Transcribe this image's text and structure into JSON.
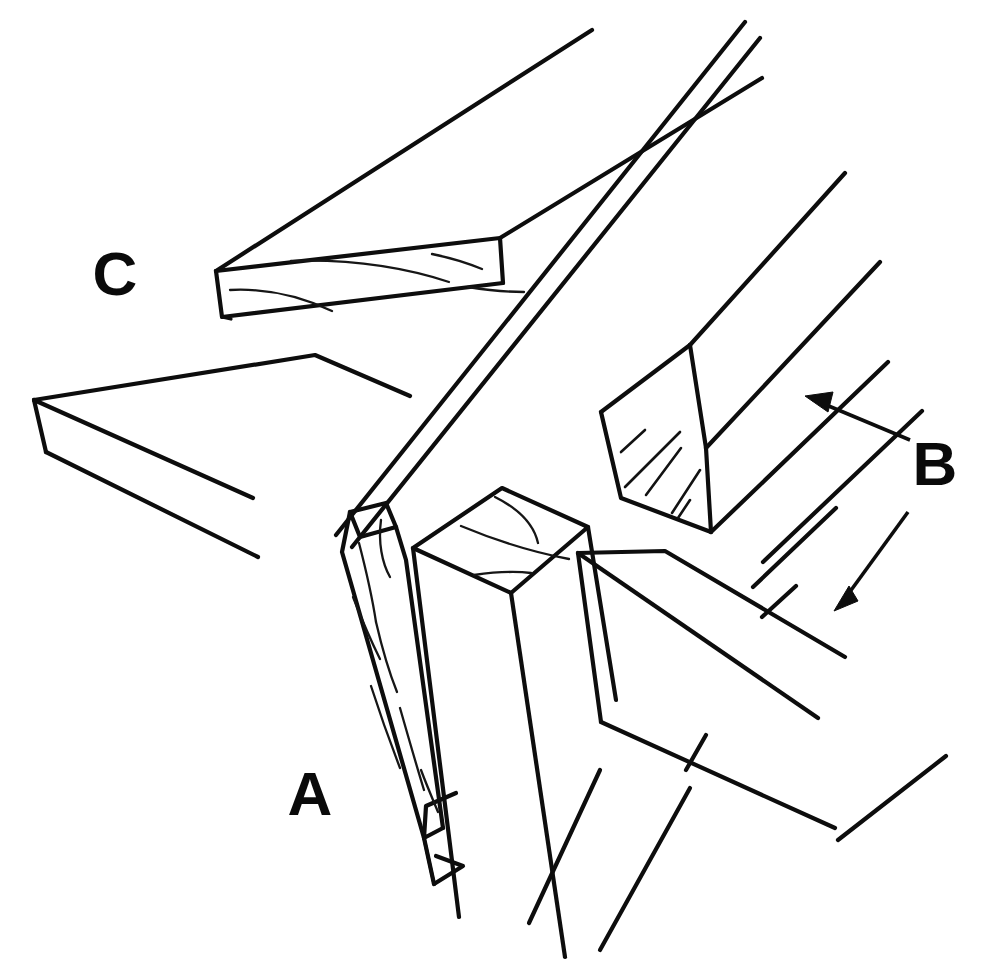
{
  "figure": {
    "background_color": "#ffffff",
    "line_color": "#0d0d0d",
    "width": 990,
    "height": 971,
    "style": "black ink technical line art, no fill, white background"
  },
  "labels": [
    {
      "id": "label-a",
      "text": "A",
      "x": 310,
      "y": 815,
      "describes": "notched narrow vertical strip / ledger at the corner post"
    },
    {
      "id": "label-b",
      "text": "B",
      "x": 935,
      "y": 485,
      "describes": "two square-section rails shown with leader arrows"
    },
    {
      "id": "label-c",
      "text": "C",
      "x": 115,
      "y": 295,
      "describes": "flat board with mitred end, upper left"
    }
  ],
  "leaders": [
    {
      "id": "leader-b-upper",
      "from_label": "B",
      "tail": [
        910,
        440
      ],
      "tip": [
        805,
        396
      ],
      "points_to": "upper square rail"
    },
    {
      "id": "leader-b-lower",
      "from_label": "B",
      "tail": [
        908,
        512
      ],
      "tip": [
        834,
        611
      ],
      "points_to": "lower square rail"
    }
  ],
  "members": [
    {
      "id": "member-c-board",
      "label": "C",
      "kind": "flat board",
      "end_treatment": "mitred / chamfered end",
      "has_grain_lines": true,
      "has_hatching": false
    },
    {
      "id": "left-panel",
      "label": "",
      "kind": "flat panel",
      "end_treatment": "open end",
      "has_grain_lines": false,
      "has_hatching": false
    },
    {
      "id": "member-a-strip",
      "label": "A",
      "kind": "narrow vertical strip",
      "end_treatment": "V-notch cut at lower end",
      "has_grain_lines": true,
      "has_hatching": false
    },
    {
      "id": "corner-post",
      "label": "",
      "kind": "square corner post",
      "end_treatment": "end grain arcs on top face",
      "has_grain_lines": true,
      "has_hatching": false
    },
    {
      "id": "member-b-upper-rail",
      "label": "B",
      "kind": "square rail",
      "end_treatment": "hatched end grain face",
      "has_grain_lines": false,
      "has_hatching": true
    },
    {
      "id": "member-b-lower-rail",
      "label": "B",
      "kind": "square rail",
      "end_treatment": "open end",
      "has_grain_lines": false,
      "has_hatching": false
    },
    {
      "id": "diagonal-strip",
      "label": "",
      "kind": "long narrow strip running diagonally",
      "end_treatment": "runs off frame",
      "has_grain_lines": false,
      "has_hatching": false
    }
  ]
}
